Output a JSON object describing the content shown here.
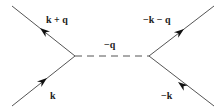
{
  "diagram": {
    "type": "feynman",
    "labels": {
      "top_left": "k + q",
      "bottom_left": "k",
      "middle": "−q",
      "top_right": "−k − q",
      "bottom_right": "−k"
    },
    "colors": {
      "line": "#555555",
      "arrow": "#111111",
      "text": "#222222"
    }
  }
}
